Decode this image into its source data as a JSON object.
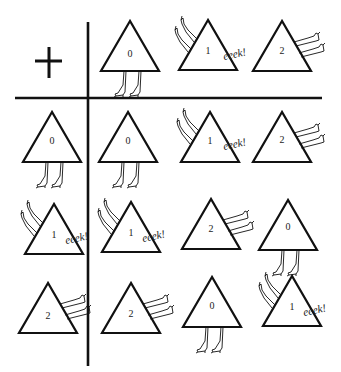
{
  "operator": "+",
  "exclamation": "eeek!",
  "colors": {
    "ink": "#111111",
    "background": "#ffffff"
  },
  "pose_legend": {
    "0": "upright-legs-down",
    "1": "tipped-legs-up-eeek",
    "2": "legs-out-right"
  },
  "header_row": [
    "0",
    "1",
    "2"
  ],
  "header_col": [
    "0",
    "1",
    "2"
  ],
  "table": [
    [
      "0",
      "1",
      "2"
    ],
    [
      "1",
      "2",
      "0"
    ],
    [
      "2",
      "0",
      "1"
    ]
  ],
  "cells": {
    "corner": {
      "label": "+"
    },
    "col_headers": [
      {
        "label": "0",
        "pose": "upright-legs-down"
      },
      {
        "label": "1",
        "pose": "tipped-legs-up-eeek"
      },
      {
        "label": "2",
        "pose": "legs-out-right"
      }
    ],
    "row_headers": [
      {
        "label": "0",
        "pose": "upright-legs-down"
      },
      {
        "label": "1",
        "pose": "tipped-legs-up-eeek"
      },
      {
        "label": "2",
        "pose": "legs-out-right"
      }
    ],
    "body": [
      [
        {
          "label": "0"
        },
        {
          "label": "1"
        },
        {
          "label": "2"
        }
      ],
      [
        {
          "label": "1"
        },
        {
          "label": "2"
        },
        {
          "label": "0"
        }
      ],
      [
        {
          "label": "2"
        },
        {
          "label": "0"
        },
        {
          "label": "1"
        }
      ]
    ]
  }
}
